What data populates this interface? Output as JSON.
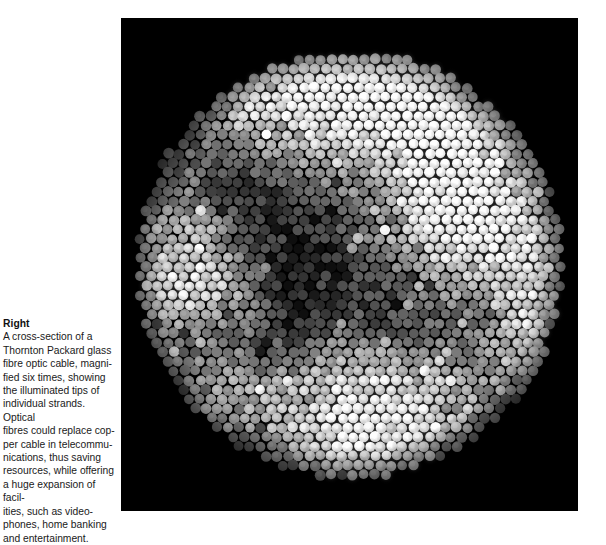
{
  "page": {
    "background_color": "#ffffff",
    "width": 606,
    "height": 532,
    "kind": "book-page-figure-with-caption"
  },
  "caption": {
    "heading": "Right",
    "body": "A cross-section of a\nThornton Packard glass\nfibre optic cable, magni-\nfied six times, showing\nthe illuminated tips of\nindividual strands. Optical\nfibres could replace cop-\nper cable in telecommu-\nnications, thus saving\nresources, while offering\na huge expansion of facil-\nities, such as video-\nphones, home banking\nand entertainment.",
    "text_color": "#111111",
    "lines": [
      "A cross-section of a",
      "Thornton Packard glass",
      "fibre optic cable, magni-",
      "fied six times, showing",
      "the illuminated tips of",
      "individual strands. Optical",
      "fibres could replace cop-",
      "per cable in telecommu-",
      "nications, thus saving",
      "resources, while offering",
      "a huge expansion of facil-",
      "ities, such as video-",
      "phones, home banking",
      "and entertainment."
    ]
  },
  "photo": {
    "alt": "Photomicrograph of a fibre optic cable cross-section: a dark field filled with a circular bundle of close-packed illuminated glass fibre tips of varying brightness",
    "panel_background_color": "#000000",
    "frame": {
      "x": 121,
      "y": 18,
      "width": 457,
      "height": 493
    }
  },
  "chart_data": {
    "type": "scatter",
    "xlabel": "",
    "ylabel": "",
    "grid": false,
    "legend": null,
    "background_color": "#000000",
    "packing": "hexagonal",
    "bundle": {
      "center_x": 229,
      "center_y": 247,
      "radius": 215,
      "fibre_diameter": 10.4,
      "fibre_spacing": 10.9,
      "approx_fibre_count": 1450,
      "shape": "circle"
    },
    "brightness": {
      "scale": "grayscale 0-255",
      "min": 14,
      "max": 252,
      "mean": 118,
      "noise": 34
    },
    "bright_patches": [
      {
        "cx": 0.46,
        "cy": 0.13,
        "r": 0.26,
        "amp": 118
      },
      {
        "cx": 0.66,
        "cy": 0.09,
        "r": 0.2,
        "amp": 104
      },
      {
        "cx": 0.28,
        "cy": 0.09,
        "r": 0.16,
        "amp": 86
      },
      {
        "cx": 0.79,
        "cy": 0.28,
        "r": 0.19,
        "amp": 96
      },
      {
        "cx": 0.68,
        "cy": 0.4,
        "r": 0.17,
        "amp": 92
      },
      {
        "cx": 0.88,
        "cy": 0.5,
        "r": 0.17,
        "amp": 100
      },
      {
        "cx": 0.93,
        "cy": 0.68,
        "r": 0.14,
        "amp": 82
      },
      {
        "cx": 0.13,
        "cy": 0.46,
        "r": 0.15,
        "amp": 78
      },
      {
        "cx": 0.07,
        "cy": 0.58,
        "r": 0.13,
        "amp": 72
      },
      {
        "cx": 0.22,
        "cy": 0.56,
        "r": 0.12,
        "amp": 66
      },
      {
        "cx": 0.5,
        "cy": 0.78,
        "r": 0.19,
        "amp": 104
      },
      {
        "cx": 0.55,
        "cy": 0.92,
        "r": 0.16,
        "amp": 92
      },
      {
        "cx": 0.72,
        "cy": 0.84,
        "r": 0.13,
        "amp": 70
      },
      {
        "cx": 0.34,
        "cy": 0.9,
        "r": 0.12,
        "amp": 58
      },
      {
        "cx": 0.2,
        "cy": 0.78,
        "r": 0.12,
        "amp": 56
      }
    ],
    "dark_patches": [
      {
        "cx": 0.42,
        "cy": 0.45,
        "r": 0.24,
        "amp": 78
      },
      {
        "cx": 0.25,
        "cy": 0.3,
        "r": 0.18,
        "amp": 62
      },
      {
        "cx": 0.38,
        "cy": 0.63,
        "r": 0.17,
        "amp": 60
      },
      {
        "cx": 0.62,
        "cy": 0.62,
        "r": 0.13,
        "amp": 52
      },
      {
        "cx": 0.15,
        "cy": 0.68,
        "r": 0.12,
        "amp": 44
      },
      {
        "cx": 0.8,
        "cy": 0.62,
        "r": 0.11,
        "amp": 46
      },
      {
        "cx": 0.55,
        "cy": 0.28,
        "r": 0.1,
        "amp": 40
      },
      {
        "cx": 0.9,
        "cy": 0.88,
        "r": 0.12,
        "amp": 50
      },
      {
        "cx": 0.3,
        "cy": 0.95,
        "r": 0.12,
        "amp": 46
      }
    ]
  }
}
